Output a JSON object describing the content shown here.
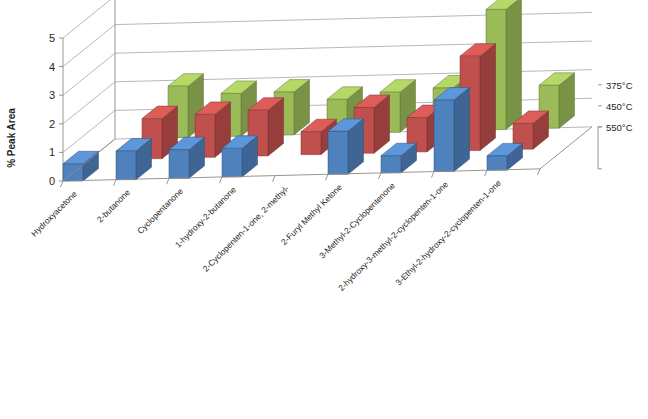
{
  "chart_data": {
    "type": "bar",
    "subtype": "3d-clustered-column",
    "title": "",
    "xlabel": "",
    "ylabel": "% Peak Area",
    "ylim": [
      0,
      5
    ],
    "ytick_labels": [
      "0",
      "1",
      "2",
      "3",
      "4",
      "5"
    ],
    "grid": true,
    "legend_position": "right-depth-axis",
    "categories": [
      "Hydroxyacetone",
      "2-butanone",
      "Cyclopentanone",
      "1-hydroxy-2-butanone",
      "2-Cyclopenten-1-one, 2-methyl-",
      "2-Furyl Methyl Ketone",
      "3-Methyl-2-Cyclopentenone",
      "2-hydroxy-3-methyl-2-cyclopenten-1-one",
      "3-Ethyl-2-hydroxy-2-cyclopenten-1-one"
    ],
    "series": [
      {
        "name": "375°C",
        "color": "#9BBB59",
        "values": [
          0,
          1.8,
          1.5,
          1.5,
          1.2,
          1.4,
          1.5,
          4.2,
          1.5
        ]
      },
      {
        "name": "450°C",
        "color": "#C0504D",
        "values": [
          0,
          1.4,
          1.5,
          1.6,
          0.8,
          1.6,
          1.2,
          3.3,
          0.9
        ]
      },
      {
        "name": "550°C",
        "color": "#4F81BD",
        "values": [
          0.6,
          1.0,
          1.0,
          1.0,
          0,
          1.5,
          0.6,
          2.5,
          0.5
        ]
      }
    ]
  },
  "axes": {
    "y_axis_title": "% Peak Area"
  },
  "legend": {
    "entries": [
      "375°C",
      "450°C",
      "550°C"
    ]
  }
}
